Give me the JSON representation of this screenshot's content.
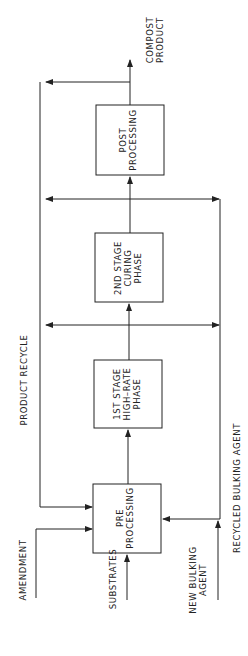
{
  "diagram": {
    "type": "process-flow",
    "orientation": "rotated-90",
    "boxes": [
      {
        "id": "pre",
        "lines": [
          "PRE",
          "PROCESSING"
        ]
      },
      {
        "id": "stage1",
        "lines": [
          "1ST  STAGE",
          "HIGH–RATE",
          "PHASE"
        ]
      },
      {
        "id": "stage2",
        "lines": [
          "2ND  STAGE",
          "CURING",
          "PHASE"
        ]
      },
      {
        "id": "post",
        "lines": [
          "POST",
          "PROCESSING"
        ]
      }
    ],
    "inputs": {
      "amendment": "AMENDMENT",
      "substrates": "SUBSTRATES",
      "new_bulking": [
        "NEW  BULKING",
        "AGENT"
      ]
    },
    "loops": {
      "product_recycle": "PRODUCT  RECYCLE",
      "recycled_bulking": "RECYCLED  BULKING  AGENT"
    },
    "output": [
      "COMPOST",
      "PRODUCT"
    ],
    "colors": {
      "line": "#222222",
      "background": "#ffffff"
    }
  }
}
